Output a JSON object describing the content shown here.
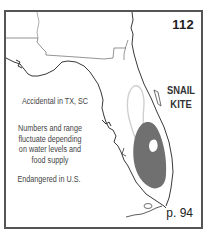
{
  "plate": {
    "number": "112",
    "species_line1": "SNAIL",
    "species_line2": "KITE",
    "notes": [
      "Accidental in TX, SC",
      "Numbers and range fluctuate depending on water levels and food supply",
      "Endangered in U.S."
    ],
    "page_ref": "p. 94"
  },
  "map": {
    "region": "Florida",
    "range_color": "#707070",
    "outline_color": "#222222",
    "light_range_color": "#d8d8d8"
  }
}
